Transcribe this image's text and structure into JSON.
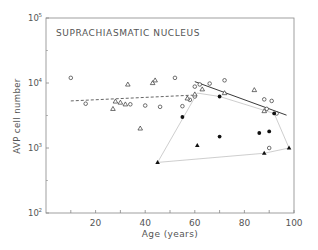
{
  "chart_data": {
    "type": "scatter",
    "title": "SUPRACHIASMATIC NUCLEUS",
    "xlabel": "Age (years)",
    "ylabel": "AVP cell number",
    "xlim": [
      0,
      100
    ],
    "ylim": [
      100,
      100000
    ],
    "yscale": "log",
    "x_ticks": [
      20,
      40,
      60,
      80,
      100
    ],
    "x_minor_ticks": [
      10,
      30,
      50,
      70,
      90
    ],
    "y_ticks": [
      "10^2",
      "10^3",
      "10^4",
      "10^5"
    ],
    "grid": false,
    "series": [
      {
        "name": "open circles",
        "marker": "open-circle",
        "points": [
          [
            10,
            12000
          ],
          [
            16,
            4800
          ],
          [
            34,
            4700
          ],
          [
            40,
            4500
          ],
          [
            46,
            4300
          ],
          [
            52,
            12000
          ],
          [
            55,
            4400
          ],
          [
            58,
            5500
          ],
          [
            60,
            6200
          ],
          [
            60,
            8800
          ],
          [
            62,
            9500
          ],
          [
            66,
            9800
          ],
          [
            72,
            11000
          ],
          [
            88,
            5600
          ],
          [
            89,
            4000
          ],
          [
            91,
            5300
          ],
          [
            93,
            3400
          ],
          [
            90,
            1000
          ]
        ]
      },
      {
        "name": "open triangles",
        "marker": "open-triangle",
        "points": [
          [
            27,
            4000
          ],
          [
            28,
            5200
          ],
          [
            30,
            5000
          ],
          [
            32,
            4700
          ],
          [
            33,
            9500
          ],
          [
            38,
            2000
          ],
          [
            43,
            10000
          ],
          [
            44,
            11000
          ],
          [
            57,
            5800
          ],
          [
            60,
            6700
          ],
          [
            63,
            8000
          ],
          [
            72,
            7000
          ],
          [
            84,
            7800
          ],
          [
            88,
            3700
          ]
        ]
      },
      {
        "name": "filled circles",
        "marker": "filled-circle",
        "points": [
          [
            55,
            3000
          ],
          [
            70,
            6200
          ],
          [
            70,
            1500
          ],
          [
            86,
            1700
          ],
          [
            90,
            1800
          ],
          [
            92,
            3400
          ]
        ]
      },
      {
        "name": "filled triangles",
        "marker": "filled-triangle",
        "points": [
          [
            45,
            600
          ],
          [
            61,
            1100
          ],
          [
            88,
            830
          ],
          [
            98,
            1000
          ]
        ]
      }
    ],
    "lines": [
      {
        "name": "dashed regression",
        "style": "dashed",
        "from": [
          10,
          5300
        ],
        "to": [
          59,
          6500
        ]
      },
      {
        "name": "solid regression",
        "style": "solid",
        "from": [
          60,
          10500
        ],
        "to": [
          97,
          3200
        ]
      },
      {
        "name": "polygon outline",
        "style": "light-solid",
        "points": [
          [
            45,
            600
          ],
          [
            61,
            7000
          ],
          [
            70,
            6200
          ],
          [
            92,
            3400
          ],
          [
            98,
            1000
          ],
          [
            88,
            830
          ],
          [
            45,
            600
          ]
        ]
      }
    ]
  },
  "labels": {
    "title": "SUPRACHIASMATIC NUCLEUS",
    "xlabel": "Age (years)",
    "ylabel": "AVP cell number",
    "x_tick_labels": [
      "20",
      "40",
      "60",
      "80",
      "100"
    ],
    "y_tick_base": "10",
    "y_tick_exps": [
      "2",
      "3",
      "4",
      "5"
    ]
  }
}
